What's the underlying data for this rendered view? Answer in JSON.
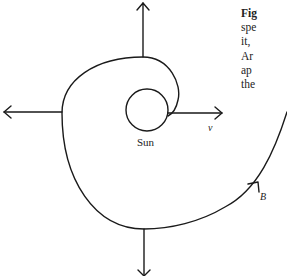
{
  "caption": {
    "lines": [
      "Fig",
      "spe",
      "it,",
      "Ar",
      "ap",
      "the"
    ]
  },
  "labels": {
    "sun": "Sun",
    "velocity": "v",
    "point_b": "B"
  },
  "colors": {
    "stroke": "#1a1a1a",
    "text": "#222222",
    "background": "#ffffff"
  }
}
